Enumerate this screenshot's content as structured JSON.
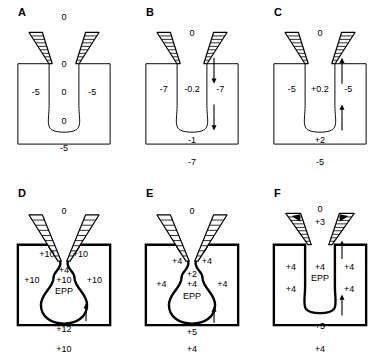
{
  "figure": {
    "type": "biological-diagram",
    "panel_count": 6,
    "rows": 2,
    "columns": 3,
    "colors": {
      "outline": "#000000",
      "background": "#ffffff",
      "electrode_fill": "#ffffff",
      "arrowhead_fill": "#000000"
    }
  },
  "panels": [
    {
      "id": "A",
      "letter": "A",
      "outline_weight": "thin",
      "neck_shape": "straight",
      "arrows": [],
      "electrode_tips": "plain",
      "labels": [
        {
          "name": "top-outside",
          "text": "0",
          "x": 86,
          "y": 18
        },
        {
          "name": "slot-upper",
          "text": "0",
          "x": 86,
          "y": 69
        },
        {
          "name": "slot-mid",
          "text": "0",
          "x": 86,
          "y": 100
        },
        {
          "name": "chamber-center",
          "text": "0",
          "x": 86,
          "y": 131
        },
        {
          "name": "left-inside",
          "text": "-5",
          "x": 48,
          "y": 100
        },
        {
          "name": "right-inside",
          "text": "-5",
          "x": 124,
          "y": 100
        },
        {
          "name": "bottom-outside",
          "text": "-5",
          "x": 86,
          "y": 160
        }
      ]
    },
    {
      "id": "B",
      "letter": "B",
      "outline_weight": "thin",
      "neck_shape": "straight",
      "arrows": [
        {
          "name": "upper-arrow",
          "direction": "down",
          "x": 86,
          "y1": 50,
          "y2": 82
        },
        {
          "name": "lower-arrow",
          "direction": "down",
          "x": 86,
          "y1": 108,
          "y2": 140
        }
      ],
      "electrode_tips": "plain",
      "labels": [
        {
          "name": "top-outside",
          "text": "0",
          "x": 86,
          "y": 36
        },
        {
          "name": "slot-mid",
          "text": "-0.2",
          "x": 86,
          "y": 96
        },
        {
          "name": "chamber-center",
          "text": "-1",
          "x": 86,
          "y": 152
        },
        {
          "name": "left-inside",
          "text": "-7",
          "x": 48,
          "y": 96
        },
        {
          "name": "right-inside",
          "text": "-7",
          "x": 124,
          "y": 96
        },
        {
          "name": "bottom-outside",
          "text": "-7",
          "x": 86,
          "y": 175
        }
      ]
    },
    {
      "id": "C",
      "letter": "C",
      "outline_weight": "thin",
      "neck_shape": "straight",
      "arrows": [
        {
          "name": "upper-arrow",
          "direction": "up",
          "x": 86,
          "y1": 82,
          "y2": 50
        },
        {
          "name": "lower-arrow",
          "direction": "up",
          "x": 86,
          "y1": 140,
          "y2": 108
        }
      ],
      "electrode_tips": "plain",
      "labels": [
        {
          "name": "top-outside",
          "text": "0",
          "x": 86,
          "y": 36
        },
        {
          "name": "slot-mid",
          "text": "+0.2",
          "x": 86,
          "y": 96
        },
        {
          "name": "chamber-center",
          "text": "+2",
          "x": 86,
          "y": 152
        },
        {
          "name": "left-inside",
          "text": "-5",
          "x": 48,
          "y": 96
        },
        {
          "name": "right-inside",
          "text": "-5",
          "x": 124,
          "y": 96
        },
        {
          "name": "bottom-outside",
          "text": "-5",
          "x": 86,
          "y": 175
        }
      ]
    },
    {
      "id": "D",
      "letter": "D",
      "outline_weight": "thick",
      "neck_shape": "bulged",
      "arrows": [
        {
          "name": "chamber-arrow",
          "direction": "up",
          "x": 86,
          "y1": 152,
          "y2": 130
        }
      ],
      "electrode_tips": "plain",
      "labels": [
        {
          "name": "top-outside",
          "text": "0",
          "x": 86,
          "y": 32
        },
        {
          "name": "neck-left",
          "text": "+10",
          "x": 63,
          "y": 79
        },
        {
          "name": "neck-right",
          "text": "+10",
          "x": 108,
          "y": 79
        },
        {
          "name": "center-upper",
          "text": "+4",
          "x": 86,
          "y": 96
        },
        {
          "name": "center-mid",
          "text": "+10",
          "x": 86,
          "y": 107
        },
        {
          "name": "center-epp",
          "text": "EPP",
          "x": 86,
          "y": 119
        },
        {
          "name": "left-inside",
          "text": "+10",
          "x": 43,
          "y": 107
        },
        {
          "name": "right-inside",
          "text": "+10",
          "x": 127,
          "y": 107
        },
        {
          "name": "chamber-center",
          "text": "+12",
          "x": 86,
          "y": 160
        },
        {
          "name": "bottom-outside",
          "text": "+10",
          "x": 86,
          "y": 182
        }
      ]
    },
    {
      "id": "E",
      "letter": "E",
      "outline_weight": "thick",
      "neck_shape": "bulged",
      "arrows": [
        {
          "name": "chamber-arrow",
          "direction": "up",
          "x": 86,
          "y1": 154,
          "y2": 134
        }
      ],
      "electrode_tips": "plain",
      "labels": [
        {
          "name": "top-outside",
          "text": "0",
          "x": 86,
          "y": 32
        },
        {
          "name": "neck-left",
          "text": "+4",
          "x": 66,
          "y": 87
        },
        {
          "name": "neck-right",
          "text": "+4",
          "x": 106,
          "y": 87
        },
        {
          "name": "center-upper",
          "text": "+2",
          "x": 86,
          "y": 101
        },
        {
          "name": "center-mid",
          "text": "+4",
          "x": 86,
          "y": 112
        },
        {
          "name": "center-epp",
          "text": "EPP",
          "x": 86,
          "y": 124
        },
        {
          "name": "left-inside",
          "text": "+4",
          "x": 45,
          "y": 112
        },
        {
          "name": "right-inside",
          "text": "+4",
          "x": 127,
          "y": 112
        },
        {
          "name": "chamber-center",
          "text": "+5",
          "x": 86,
          "y": 163
        },
        {
          "name": "bottom-outside",
          "text": "+4",
          "x": 86,
          "y": 182
        }
      ]
    },
    {
      "id": "F",
      "letter": "F",
      "outline_weight": "thick",
      "neck_shape": "straight",
      "arrows": [
        {
          "name": "upper-arrow",
          "direction": "up",
          "x": 86,
          "y1": 75,
          "y2": 52
        },
        {
          "name": "lower-arrow",
          "direction": "up",
          "x": 86,
          "y1": 145,
          "y2": 119
        }
      ],
      "electrode_tips": "filled-arrowhead",
      "labels": [
        {
          "name": "top-outside",
          "text": "0",
          "x": 86,
          "y": 30
        },
        {
          "name": "tip-value",
          "text": "+3",
          "x": 86,
          "y": 44
        },
        {
          "name": "center-mid",
          "text": "+4",
          "x": 86,
          "y": 93
        },
        {
          "name": "center-epp",
          "text": "EPP",
          "x": 86,
          "y": 105
        },
        {
          "name": "left-upper",
          "text": "+4",
          "x": 47,
          "y": 93
        },
        {
          "name": "right-upper",
          "text": "+4",
          "x": 125,
          "y": 93
        },
        {
          "name": "left-lower",
          "text": "+4",
          "x": 47,
          "y": 117
        },
        {
          "name": "right-lower",
          "text": "+4",
          "x": 125,
          "y": 117
        },
        {
          "name": "chamber-center",
          "text": "+5",
          "x": 86,
          "y": 157
        },
        {
          "name": "bottom-outside",
          "text": "+4",
          "x": 86,
          "y": 182
        }
      ]
    }
  ]
}
